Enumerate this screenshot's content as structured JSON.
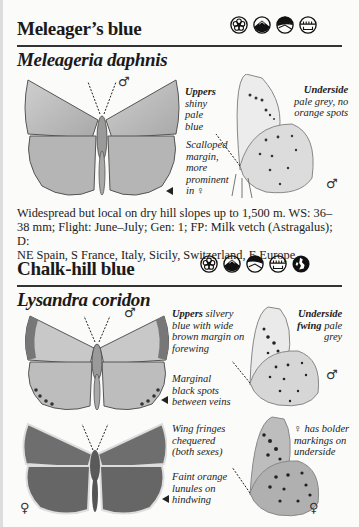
{
  "entries": [
    {
      "common_name": "Meleager’s blue",
      "latin_name": "Meleageria daphnis",
      "habitat_icons": [
        "flower-meadow-icon",
        "mountain-icon",
        "hill-slope-icon",
        "grassland-fence-icon"
      ],
      "captions": {
        "uppers_bold": "Uppers",
        "uppers_rest_lines": [
          "shiny",
          "pale",
          "blue"
        ],
        "underside_bold": "Underside",
        "underside_rest_lines": [
          "pale grey, no",
          "orange spots"
        ],
        "margin_lines": [
          "Scalloped",
          "margin,",
          "more",
          "prominent",
          "in ♀"
        ]
      },
      "sex_marks": {
        "upper": "♂",
        "under": "♂"
      },
      "description_lines": [
        "Widespread but local on dry hill slopes up to 1,500 m. WS: 36–",
        "38 mm; Flight: June–July; Gen: 1; FP: Milk vetch (Astragalus); D:",
        "NE Spain, S France, Italy, Sicily, Switzerland, E Europe."
      ],
      "facts": {
        "altitude": "1,500 m",
        "wingspan": "36–38 mm",
        "flight": "June–July",
        "generations": "1",
        "food_plant": "Milk vetch (Astragalus)",
        "distribution": "NE Spain, S France, Italy, Sicily, Switzerland, E Europe."
      }
    },
    {
      "common_name": "Chalk-hill blue",
      "latin_name": "Lysandra coridon",
      "habitat_icons": [
        "flower-meadow-icon",
        "mountain-icon",
        "hill-slope-icon",
        "grassland-fence-icon",
        "british-isles-icon"
      ],
      "captions": {
        "uppers_bold": "Uppers",
        "uppers_rest_lines": [
          " silvery",
          "blue with wide",
          "brown margin on",
          "forewing"
        ],
        "underside_bold": "Underside",
        "fwing_bold": "fwing",
        "underside_rest_lines": [
          " pale",
          "grey"
        ],
        "marginal_lines": [
          "Marginal",
          "black spots",
          "between veins"
        ],
        "fringes_lines": [
          "Wing fringes",
          "chequered",
          "(both sexes)"
        ],
        "female_lines": [
          "♀ has bolder",
          "markings on",
          "underside"
        ],
        "lunules_lines": [
          "Faint orange",
          "lunules on",
          "hindwing"
        ]
      },
      "sex_marks": {
        "male_upper": "♂",
        "male_under": "♂",
        "female_upper": "♀",
        "female_under": "♀"
      }
    }
  ],
  "colors": {
    "page": "#fbfbf9",
    "text": "#1a1a1a",
    "wing_male_grey": "#b9b9b9",
    "wing_female_dark": "#6a6a6a",
    "underside_light": "#e6e6e6"
  }
}
